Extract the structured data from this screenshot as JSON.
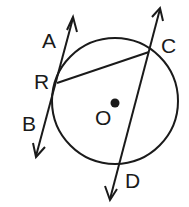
{
  "diagram": {
    "title": "",
    "circle": {
      "center_label": "O",
      "cx": 115,
      "cy": 101,
      "r": 63
    },
    "points": {
      "A": {
        "label": "A"
      },
      "B": {
        "label": "B"
      },
      "R": {
        "label": "R"
      },
      "C": {
        "label": "C"
      },
      "D": {
        "label": "D"
      },
      "O": {
        "label": "O"
      }
    },
    "elements": [
      {
        "type": "tangent-line",
        "through": [
          "A",
          "R",
          "B"
        ],
        "arrows": "both"
      },
      {
        "type": "secant-line",
        "through": [
          "C",
          "D"
        ],
        "arrows": "both"
      },
      {
        "type": "chord",
        "from": "R",
        "to": "C"
      },
      {
        "type": "center-point",
        "label": "O"
      }
    ],
    "colors": {
      "stroke": "#1a1a1a",
      "background": "#ffffff"
    }
  }
}
